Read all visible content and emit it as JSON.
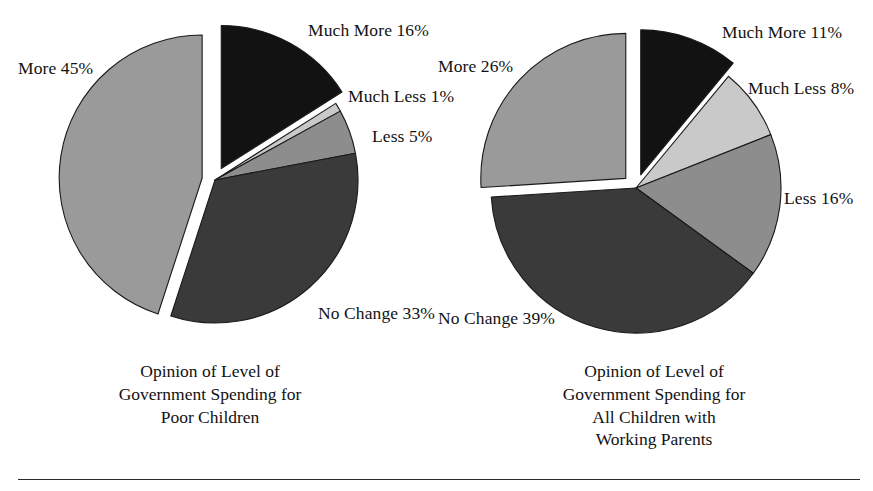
{
  "figure": {
    "width": 873,
    "height": 491,
    "background": "#ffffff",
    "has_bottom_rule": true
  },
  "palette": {
    "much_more": "#121212",
    "much_less": "#c9c9c9",
    "less": "#8d8d8d",
    "no_change": "#3a3a3a",
    "more": "#9a9a9a",
    "outline": "#1a1a1a",
    "text": "#121212",
    "rule": "#2c2c2c"
  },
  "chart_data": [
    {
      "type": "pie",
      "id": "poor-children",
      "title": "Opinion of Level of Government Spending for Poor Children",
      "title_lines": [
        "Opinion of Level of",
        "Government Spending for",
        "Poor Children"
      ],
      "units": "percent",
      "start_angle": 0,
      "direction": "clockwise",
      "categories": [
        "Much More",
        "Much Less",
        "Less",
        "No Change",
        "More"
      ],
      "values": [
        16,
        1,
        5,
        33,
        45
      ],
      "labels": [
        "Much More 16%",
        "Much Less 1%",
        "Less 5%",
        "No Change 33%",
        "More 45%"
      ],
      "colors": [
        "#121212",
        "#c9c9c9",
        "#8d8d8d",
        "#3a3a3a",
        "#9a9a9a"
      ],
      "exploded": [
        true,
        false,
        false,
        false,
        true
      ],
      "legend": "none",
      "grid": false
    },
    {
      "type": "pie",
      "id": "all-children-working-parents",
      "title": "Opinion of Level of Government Spending for All Children with Working Parents",
      "title_lines": [
        "Opinion of Level of",
        "Government Spending for",
        "All Children with",
        "Working Parents"
      ],
      "units": "percent",
      "start_angle": 0,
      "direction": "clockwise",
      "categories": [
        "Much More",
        "Much Less",
        "Less",
        "No Change",
        "More"
      ],
      "values": [
        11,
        8,
        16,
        39,
        26
      ],
      "labels": [
        "Much More 11%",
        "Much Less 8%",
        "Less 16%",
        "No Change 39%",
        "More 26%"
      ],
      "colors": [
        "#121212",
        "#c9c9c9",
        "#8d8d8d",
        "#3a3a3a",
        "#9a9a9a"
      ],
      "exploded": [
        true,
        false,
        false,
        false,
        true
      ],
      "legend": "none",
      "grid": false
    }
  ],
  "left_chart": {
    "caption_lines": [
      "Opinion of Level of",
      "Government Spending for",
      "Poor Children"
    ],
    "labels": {
      "much_more": "Much More 16%",
      "much_less": "Much Less 1%",
      "less": "Less 5%",
      "no_change": "No Change 33%",
      "more": "More 45%"
    }
  },
  "right_chart": {
    "caption_lines": [
      "Opinion of Level of",
      "Government Spending for",
      "All Children with",
      "Working Parents"
    ],
    "labels": {
      "much_more": "Much More 11%",
      "much_less": "Much Less 8%",
      "less": "Less 16%",
      "no_change": "No Change 39%",
      "more": "More 26%"
    }
  }
}
